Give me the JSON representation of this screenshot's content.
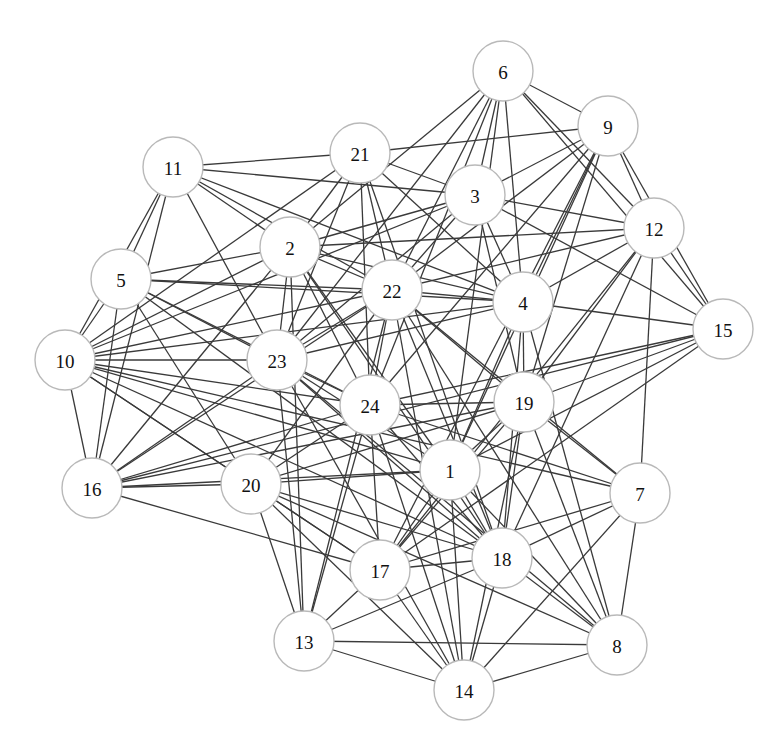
{
  "diagram": {
    "type": "undirected-graph",
    "node_radius": 30,
    "colors": {
      "background": "#ffffff",
      "edge": "#3a3a3a",
      "node_fill": "#ffffff",
      "node_stroke": "#b9b9b9",
      "label": "#111111"
    },
    "nodes": [
      {
        "id": "1",
        "label": "1",
        "x": 450,
        "y": 470
      },
      {
        "id": "2",
        "label": "2",
        "x": 290,
        "y": 247
      },
      {
        "id": "3",
        "label": "3",
        "x": 475,
        "y": 195
      },
      {
        "id": "4",
        "label": "4",
        "x": 523,
        "y": 302
      },
      {
        "id": "5",
        "label": "5",
        "x": 121,
        "y": 279
      },
      {
        "id": "6",
        "label": "6",
        "x": 503,
        "y": 71
      },
      {
        "id": "7",
        "label": "7",
        "x": 640,
        "y": 493
      },
      {
        "id": "8",
        "label": "8",
        "x": 617,
        "y": 645
      },
      {
        "id": "9",
        "label": "9",
        "x": 608,
        "y": 126
      },
      {
        "id": "10",
        "label": "10",
        "x": 65,
        "y": 360
      },
      {
        "id": "11",
        "label": "11",
        "x": 173,
        "y": 167
      },
      {
        "id": "12",
        "label": "12",
        "x": 654,
        "y": 228
      },
      {
        "id": "13",
        "label": "13",
        "x": 304,
        "y": 641
      },
      {
        "id": "14",
        "label": "14",
        "x": 464,
        "y": 690
      },
      {
        "id": "15",
        "label": "15",
        "x": 723,
        "y": 329
      },
      {
        "id": "16",
        "label": "16",
        "x": 92,
        "y": 488
      },
      {
        "id": "17",
        "label": "17",
        "x": 380,
        "y": 570
      },
      {
        "id": "18",
        "label": "18",
        "x": 502,
        "y": 558
      },
      {
        "id": "19",
        "label": "19",
        "x": 524,
        "y": 402
      },
      {
        "id": "20",
        "label": "20",
        "x": 251,
        "y": 484
      },
      {
        "id": "21",
        "label": "21",
        "x": 360,
        "y": 153
      },
      {
        "id": "22",
        "label": "22",
        "x": 392,
        "y": 290
      },
      {
        "id": "23",
        "label": "23",
        "x": 277,
        "y": 360
      },
      {
        "id": "24",
        "label": "24",
        "x": 370,
        "y": 405
      }
    ],
    "edges": [
      [
        "11",
        "21"
      ],
      [
        "11",
        "3"
      ],
      [
        "11",
        "4"
      ],
      [
        "11",
        "22"
      ],
      [
        "11",
        "2"
      ],
      [
        "11",
        "23"
      ],
      [
        "11",
        "5"
      ],
      [
        "11",
        "10"
      ],
      [
        "11",
        "16"
      ],
      [
        "21",
        "9"
      ],
      [
        "21",
        "2"
      ],
      [
        "21",
        "3"
      ],
      [
        "21",
        "22"
      ],
      [
        "21",
        "24"
      ],
      [
        "21",
        "10"
      ],
      [
        "21",
        "23"
      ],
      [
        "21",
        "4"
      ],
      [
        "21",
        "18"
      ],
      [
        "6",
        "9"
      ],
      [
        "6",
        "12"
      ],
      [
        "6",
        "15"
      ],
      [
        "6",
        "4"
      ],
      [
        "6",
        "22"
      ],
      [
        "6",
        "24"
      ],
      [
        "6",
        "3"
      ],
      [
        "6",
        "2"
      ],
      [
        "6",
        "23"
      ],
      [
        "6",
        "1"
      ],
      [
        "9",
        "12"
      ],
      [
        "9",
        "15"
      ],
      [
        "9",
        "3"
      ],
      [
        "9",
        "22"
      ],
      [
        "9",
        "4"
      ],
      [
        "9",
        "19"
      ],
      [
        "9",
        "1"
      ],
      [
        "9",
        "17"
      ],
      [
        "9",
        "24"
      ],
      [
        "3",
        "12"
      ],
      [
        "3",
        "15"
      ],
      [
        "3",
        "2"
      ],
      [
        "3",
        "4"
      ],
      [
        "3",
        "22"
      ],
      [
        "3",
        "23"
      ],
      [
        "3",
        "19"
      ],
      [
        "3",
        "10"
      ],
      [
        "12",
        "2"
      ],
      [
        "12",
        "15"
      ],
      [
        "12",
        "4"
      ],
      [
        "12",
        "22"
      ],
      [
        "12",
        "18"
      ],
      [
        "12",
        "17"
      ],
      [
        "12",
        "19"
      ],
      [
        "12",
        "7"
      ],
      [
        "15",
        "4"
      ],
      [
        "15",
        "24"
      ],
      [
        "15",
        "19"
      ],
      [
        "15",
        "1"
      ],
      [
        "15",
        "17"
      ],
      [
        "15",
        "16"
      ],
      [
        "4",
        "5"
      ],
      [
        "4",
        "2"
      ],
      [
        "4",
        "22"
      ],
      [
        "4",
        "10"
      ],
      [
        "4",
        "19"
      ],
      [
        "4",
        "1"
      ],
      [
        "4",
        "18"
      ],
      [
        "4",
        "8"
      ],
      [
        "4",
        "23"
      ],
      [
        "2",
        "5"
      ],
      [
        "2",
        "22"
      ],
      [
        "2",
        "23"
      ],
      [
        "2",
        "24"
      ],
      [
        "2",
        "18"
      ],
      [
        "2",
        "1"
      ],
      [
        "2",
        "10"
      ],
      [
        "2",
        "16"
      ],
      [
        "2",
        "13"
      ],
      [
        "5",
        "22"
      ],
      [
        "5",
        "23"
      ],
      [
        "5",
        "24"
      ],
      [
        "5",
        "10"
      ],
      [
        "5",
        "16"
      ],
      [
        "5",
        "20"
      ],
      [
        "5",
        "18"
      ],
      [
        "10",
        "22"
      ],
      [
        "10",
        "23"
      ],
      [
        "10",
        "16"
      ],
      [
        "10",
        "1"
      ],
      [
        "10",
        "18"
      ],
      [
        "10",
        "17"
      ],
      [
        "10",
        "24"
      ],
      [
        "10",
        "20"
      ],
      [
        "10",
        "7"
      ],
      [
        "22",
        "23"
      ],
      [
        "22",
        "24"
      ],
      [
        "22",
        "19"
      ],
      [
        "22",
        "18"
      ],
      [
        "22",
        "20"
      ],
      [
        "22",
        "16"
      ],
      [
        "22",
        "7"
      ],
      [
        "22",
        "13"
      ],
      [
        "22",
        "8"
      ],
      [
        "22",
        "14"
      ],
      [
        "23",
        "24"
      ],
      [
        "23",
        "16"
      ],
      [
        "23",
        "13"
      ],
      [
        "23",
        "14"
      ],
      [
        "23",
        "8"
      ],
      [
        "23",
        "18"
      ],
      [
        "23",
        "1"
      ],
      [
        "24",
        "19"
      ],
      [
        "24",
        "16"
      ],
      [
        "24",
        "20"
      ],
      [
        "24",
        "17"
      ],
      [
        "24",
        "13"
      ],
      [
        "24",
        "18"
      ],
      [
        "24",
        "7"
      ],
      [
        "24",
        "14"
      ],
      [
        "19",
        "16"
      ],
      [
        "19",
        "20"
      ],
      [
        "19",
        "1"
      ],
      [
        "19",
        "17"
      ],
      [
        "19",
        "18"
      ],
      [
        "19",
        "7"
      ],
      [
        "19",
        "8"
      ],
      [
        "19",
        "14"
      ],
      [
        "1",
        "20"
      ],
      [
        "1",
        "17"
      ],
      [
        "1",
        "18"
      ],
      [
        "1",
        "14"
      ],
      [
        "1",
        "8"
      ],
      [
        "1",
        "16"
      ],
      [
        "16",
        "20"
      ],
      [
        "16",
        "17"
      ],
      [
        "20",
        "13"
      ],
      [
        "20",
        "17"
      ],
      [
        "20",
        "18"
      ],
      [
        "20",
        "8"
      ],
      [
        "20",
        "14"
      ],
      [
        "7",
        "18"
      ],
      [
        "7",
        "17"
      ],
      [
        "7",
        "8"
      ],
      [
        "7",
        "14"
      ],
      [
        "17",
        "18"
      ],
      [
        "17",
        "13"
      ],
      [
        "17",
        "14"
      ],
      [
        "18",
        "13"
      ],
      [
        "18",
        "14"
      ],
      [
        "18",
        "8"
      ],
      [
        "13",
        "8"
      ],
      [
        "13",
        "14"
      ],
      [
        "8",
        "14"
      ]
    ]
  }
}
